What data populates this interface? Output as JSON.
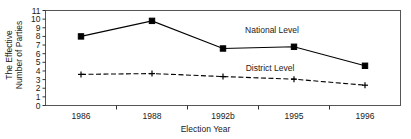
{
  "chart_data": {
    "type": "line",
    "title": "",
    "xlabel": "Election Year",
    "ylabel": "The Effective Number of Parties",
    "ylabel_line1": "The Effective",
    "ylabel_line2": "Number of Parties",
    "categories": [
      "1986",
      "1988",
      "1992b",
      "1995",
      "1996"
    ],
    "ylim": [
      0,
      11
    ],
    "yticks": [
      0,
      1,
      2,
      3,
      4,
      5,
      6,
      7,
      8,
      9,
      10,
      11
    ],
    "ytick_labels": [
      "0",
      "1",
      "2",
      "3",
      "4",
      "5",
      "6",
      "7",
      "8",
      "9",
      "10",
      "11"
    ],
    "grid": false,
    "legend_position": "inline-annotation",
    "series": [
      {
        "name": "National Level",
        "values": [
          8.0,
          9.8,
          6.6,
          6.8,
          4.6
        ],
        "line_style": "solid",
        "marker": "filled-square",
        "color": "#000000",
        "label_x": 272,
        "label_y": 33
      },
      {
        "name": "District Level",
        "values": [
          3.6,
          3.7,
          3.35,
          3.05,
          2.35
        ],
        "line_style": "dashed",
        "marker": "plus",
        "color": "#000000",
        "label_x": 270,
        "label_y": 71
      }
    ]
  },
  "axis": {
    "x_title": "Election Year",
    "y_title_line1": "The Effective",
    "y_title_line2": "Number of Parties"
  }
}
